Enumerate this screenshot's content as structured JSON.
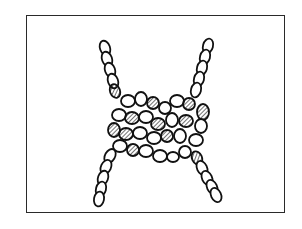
{
  "illustration": {
    "subject": "rope knot",
    "style": "black ink line drawing with hatched shading",
    "frame": {
      "x": 26,
      "y": 15,
      "width": 259,
      "height": 198,
      "stroke": "#2a2a2a"
    },
    "background": "#ffffff",
    "ink": "#111111",
    "rope_ends": [
      {
        "name": "top-left-end",
        "from": [
          104,
          44
        ],
        "to": [
          118,
          100
        ]
      },
      {
        "name": "top-right-end",
        "from": [
          208,
          42
        ],
        "to": [
          192,
          100
        ]
      },
      {
        "name": "bottom-left-end",
        "from": [
          112,
          150
        ],
        "to": [
          98,
          202
        ]
      },
      {
        "name": "bottom-right-end",
        "from": [
          198,
          152
        ],
        "to": [
          218,
          193
        ]
      }
    ],
    "knot_center": [
      158,
      128
    ]
  }
}
